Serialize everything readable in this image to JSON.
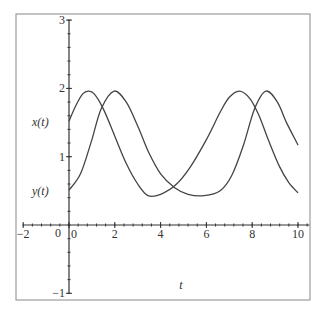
{
  "chart_data": {
    "type": "line",
    "title": "",
    "xlabel": "t",
    "ylabel": "",
    "xlim": [
      -2,
      10.5
    ],
    "ylim": [
      -1,
      3
    ],
    "grid": false,
    "x_ticks": [
      -2,
      0,
      2,
      4,
      6,
      8,
      10
    ],
    "x_tick_labels": [
      "−2",
      "0",
      "2",
      "4",
      "6",
      "8",
      "10"
    ],
    "y_ticks": [
      -1,
      0,
      1,
      2,
      3
    ],
    "y_tick_labels": [
      "−1",
      "0",
      "1",
      "2",
      "3"
    ],
    "series": [
      {
        "name": "x(t)",
        "label_value": 1.5,
        "x": [
          0,
          0.3,
          0.6,
          0.85,
          1.1,
          1.5,
          2.0,
          2.5,
          3.0,
          3.45,
          4.0,
          4.7,
          5.3,
          6.0,
          6.6,
          7.0,
          7.45,
          7.9,
          8.3,
          8.7,
          9.2,
          9.6,
          10
        ],
        "values": [
          1.52,
          1.75,
          1.92,
          1.96,
          1.92,
          1.7,
          1.3,
          0.9,
          0.6,
          0.43,
          0.45,
          0.6,
          0.85,
          1.25,
          1.65,
          1.87,
          1.96,
          1.85,
          1.6,
          1.25,
          0.85,
          0.62,
          0.47
        ]
      },
      {
        "name": "y(t)",
        "label_value": 0.5,
        "x": [
          0,
          0.5,
          1.0,
          1.4,
          1.97,
          2.5,
          3.0,
          3.5,
          4.0,
          4.6,
          5.2,
          5.9,
          6.6,
          7.1,
          7.6,
          8.1,
          8.6,
          9.1,
          9.5,
          10
        ],
        "values": [
          0.51,
          0.75,
          1.25,
          1.7,
          1.96,
          1.8,
          1.45,
          1.05,
          0.75,
          0.55,
          0.45,
          0.43,
          0.5,
          0.72,
          1.15,
          1.7,
          1.96,
          1.8,
          1.5,
          1.17
        ]
      }
    ],
    "legend": null
  },
  "labels": {
    "x_axis": "t",
    "series_x": "x(t)",
    "series_y": "y(t)",
    "origin_left": "0"
  }
}
